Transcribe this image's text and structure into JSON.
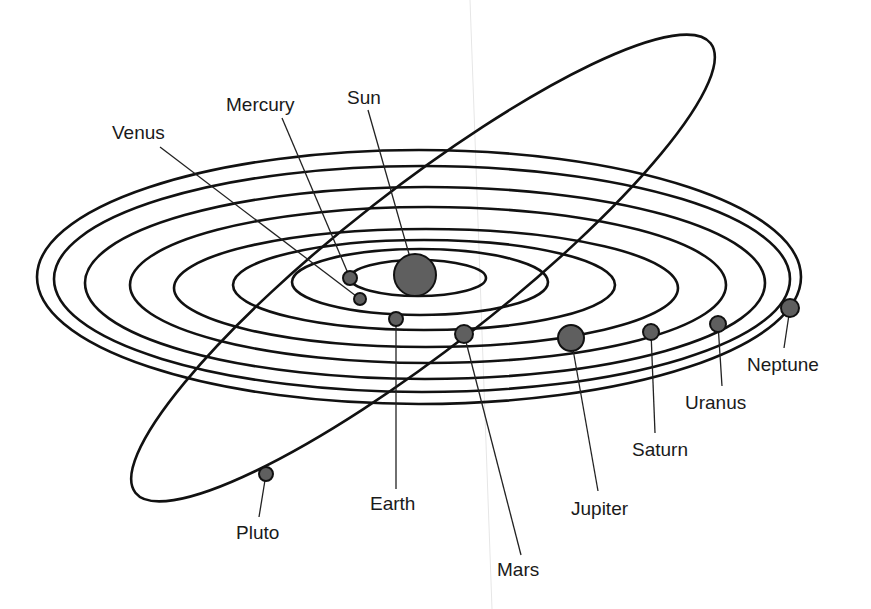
{
  "diagram": {
    "colors": {
      "orbit": "#111111",
      "planet_fill": "#5f5f5f",
      "label": "#1a1a1a",
      "background": "#ffffff"
    },
    "sun": {
      "label": "Sun",
      "cx": 415,
      "cy": 275,
      "r": 21
    },
    "orbits": [
      {
        "name": "mercury-orbit",
        "cx": 418,
        "cy": 278,
        "rx": 68,
        "ry": 18
      },
      {
        "name": "venus-orbit",
        "cx": 420,
        "cy": 282,
        "rx": 128,
        "ry": 33
      },
      {
        "name": "earth-orbit",
        "cx": 424,
        "cy": 285,
        "rx": 191,
        "ry": 45
      },
      {
        "name": "mars-orbit",
        "cx": 426,
        "cy": 288,
        "rx": 252,
        "ry": 59
      },
      {
        "name": "jupiter-orbit",
        "cx": 428,
        "cy": 285,
        "rx": 298,
        "ry": 78
      },
      {
        "name": "saturn-orbit",
        "cx": 425,
        "cy": 283,
        "rx": 340,
        "ry": 96
      },
      {
        "name": "uranus-orbit",
        "cx": 422,
        "cy": 279,
        "rx": 368,
        "ry": 113
      },
      {
        "name": "neptune-orbit",
        "cx": 419,
        "cy": 277,
        "rx": 382,
        "ry": 127
      }
    ],
    "pluto_orbit": {
      "cx": 423,
      "cy": 268,
      "rx": 365,
      "ry": 80,
      "rotate": -38
    },
    "planets": [
      {
        "label": "Mercury",
        "cx": 350,
        "cy": 278,
        "r": 7,
        "lx": 226,
        "ly": 111,
        "ax": 282,
        "ay": 118
      },
      {
        "label": "Venus",
        "cx": 360,
        "cy": 299,
        "r": 6,
        "lx": 112,
        "ly": 139,
        "ax": 160,
        "ay": 147
      },
      {
        "label": "Earth",
        "cx": 396,
        "cy": 319,
        "r": 7,
        "lx": 370,
        "ly": 510,
        "ax": 396,
        "ay": 489
      },
      {
        "label": "Mars",
        "cx": 464,
        "cy": 334,
        "r": 9,
        "lx": 497,
        "ly": 576,
        "ax": 521,
        "ay": 555
      },
      {
        "label": "Jupiter",
        "cx": 571,
        "cy": 338,
        "r": 13,
        "lx": 571,
        "ly": 515,
        "ax": 598,
        "ay": 491
      },
      {
        "label": "Saturn",
        "cx": 651,
        "cy": 332,
        "r": 8,
        "lx": 632,
        "ly": 456,
        "ax": 655,
        "ay": 433
      },
      {
        "label": "Uranus",
        "cx": 718,
        "cy": 324,
        "r": 8,
        "lx": 685,
        "ly": 409,
        "ax": 722,
        "ay": 386
      },
      {
        "label": "Neptune",
        "cx": 790,
        "cy": 308,
        "r": 9,
        "lx": 747,
        "ly": 371,
        "ax": 784,
        "ay": 348
      },
      {
        "label": "Pluto",
        "cx": 266,
        "cy": 474,
        "r": 7,
        "lx": 236,
        "ly": 539,
        "ax": 259,
        "ay": 517
      }
    ],
    "sun_label": {
      "label": "Sun",
      "lx": 347,
      "ly": 104,
      "ax": 368,
      "ay": 110
    }
  }
}
